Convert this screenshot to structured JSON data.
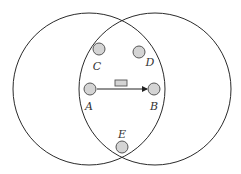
{
  "diagram": {
    "type": "wireless-range-diagram",
    "ranges": [
      {
        "id": "range-A",
        "center_node": "A"
      },
      {
        "id": "range-B",
        "center_node": "B"
      }
    ],
    "nodes": [
      {
        "id": "C",
        "label": "C"
      },
      {
        "id": "D",
        "label": "D"
      },
      {
        "id": "A",
        "label": "A"
      },
      {
        "id": "B",
        "label": "B"
      },
      {
        "id": "E",
        "label": "E"
      }
    ],
    "edges": [
      {
        "from": "A",
        "to": "B",
        "directed": true,
        "packet": true
      }
    ],
    "colors": {
      "node_fill": "#d4d4d4",
      "stroke": "#2a2a2a"
    }
  }
}
